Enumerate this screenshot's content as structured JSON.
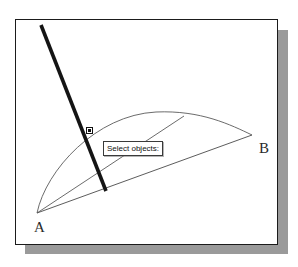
{
  "app": {
    "name": "cad-drawing-viewport",
    "background_color": "#ffffff",
    "frame_border_color": "#1b1b1b",
    "frame_shadow_color": "#9a9a9a",
    "geometry_color": "#555555",
    "highlight_color": "#141414"
  },
  "prompt": {
    "text": "Select objects:",
    "background_color": "#ffffff",
    "border_color": "#3a3a3a"
  },
  "labels": {
    "point_a": "A",
    "point_b": "B"
  },
  "cursor": {
    "pickbox_name": "pickbox-cursor",
    "x": 73,
    "y": 111
  },
  "drawing": {
    "selected_line": {
      "name": "selected-section-line",
      "x1": 41,
      "y1": 25,
      "x2": 106,
      "y2": 191,
      "stroke_width": 3.6,
      "color": "#141414"
    },
    "chord_line": {
      "name": "chord-line-a-to-b",
      "x1": 37,
      "y1": 213,
      "x2": 252,
      "y2": 135
    },
    "upper_line": {
      "name": "upper-line-from-a",
      "x1": 37,
      "y1": 213,
      "x2": 184,
      "y2": 116
    },
    "arc": {
      "name": "arc-a-to-b",
      "start_x": 37,
      "start_y": 213,
      "end_x": 252,
      "end_y": 135,
      "apex_x": 160,
      "apex_y": 112
    }
  }
}
